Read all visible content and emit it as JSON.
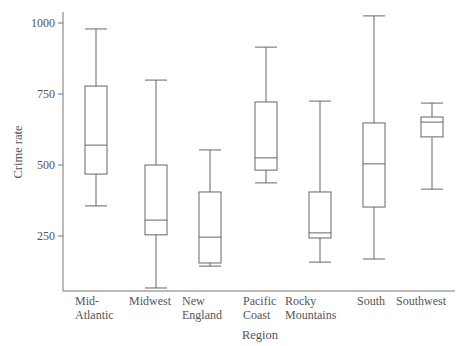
{
  "chart_data": {
    "type": "box",
    "title": "",
    "xlabel": "Region",
    "ylabel": "Crime rate",
    "ylim": [
      46,
      1035
    ],
    "yticks": [
      250,
      500,
      750,
      1000
    ],
    "grid": false,
    "legend": null,
    "categories": [
      "Mid-Atlantic",
      "Midwest",
      "New England",
      "Pacific Coast",
      "Rocky Mountains",
      "South",
      "Southwest"
    ],
    "category_lines": [
      [
        "Mid-",
        "Atlantic"
      ],
      [
        "Midwest"
      ],
      [
        "New",
        "England"
      ],
      [
        "Pacific",
        "Coast"
      ],
      [
        "Rocky",
        "Mountains"
      ],
      [
        "South"
      ],
      [
        "Southwest"
      ]
    ],
    "boxes": [
      {
        "name": "Mid-Atlantic",
        "min": 356,
        "q1": 468,
        "median": 570,
        "q3": 778,
        "max": 979
      },
      {
        "name": "Midwest",
        "min": 67,
        "q1": 254,
        "median": 306,
        "q3": 500,
        "max": 799
      },
      {
        "name": "New England",
        "min": 144,
        "q1": 155,
        "median": 246,
        "q3": 405,
        "max": 553
      },
      {
        "name": "Pacific Coast",
        "min": 437,
        "q1": 482,
        "median": 525,
        "q3": 722,
        "max": 915
      },
      {
        "name": "Rocky Mountains",
        "min": 158,
        "q1": 243,
        "median": 261,
        "q3": 405,
        "max": 725
      },
      {
        "name": "South",
        "min": 169,
        "q1": 352,
        "median": 504,
        "q3": 648,
        "max": 1025
      },
      {
        "name": "Southwest",
        "min": 415,
        "q1": 599,
        "median": 651,
        "q3": 669,
        "max": 718
      }
    ]
  },
  "colors": {
    "axis": "#777777",
    "box": "#666666",
    "text": "#555555",
    "background": "#ffffff"
  }
}
